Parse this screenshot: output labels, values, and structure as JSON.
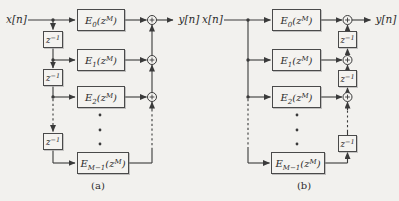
{
  "colors": {
    "background": "#f2f1ee",
    "line": "#3a3a3a",
    "text": "#2c2c2c"
  },
  "diagram_a": {
    "caption": "(a)",
    "input_label": "x[n]",
    "output_label": "y[n]",
    "delay": {
      "base": "z",
      "sup": "−1"
    },
    "filters": [
      {
        "base": "E",
        "sub": "0",
        "arg": "(z",
        "sup": "M",
        "close": ")"
      },
      {
        "base": "E",
        "sub": "1",
        "arg": "(z",
        "sup": "M",
        "close": ")"
      },
      {
        "base": "E",
        "sub": "2",
        "arg": "(z",
        "sup": "M",
        "close": ")"
      },
      {
        "base": "E",
        "sub": "M−1",
        "arg": "(z",
        "sup": "M",
        "close": ")"
      }
    ]
  },
  "diagram_b": {
    "caption": "(b)",
    "input_label": "x[n]",
    "output_label": "y[n]",
    "delay": {
      "base": "z",
      "sup": "−1"
    },
    "filters": [
      {
        "base": "E",
        "sub": "0",
        "arg": "(z",
        "sup": "M",
        "close": ")"
      },
      {
        "base": "E",
        "sub": "1",
        "arg": "(z",
        "sup": "M",
        "close": ")"
      },
      {
        "base": "E",
        "sub": "2",
        "arg": "(z",
        "sup": "M",
        "close": ")"
      },
      {
        "base": "E",
        "sub": "M−1",
        "arg": "(z",
        "sup": "M",
        "close": ")"
      }
    ]
  }
}
